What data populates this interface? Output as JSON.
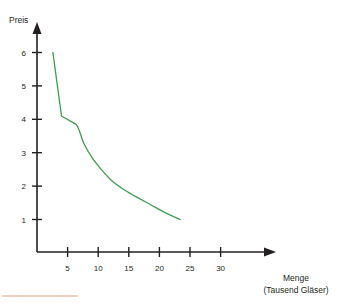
{
  "chart_data": {
    "type": "line",
    "title": "",
    "subtitle": "",
    "xlabel": "Menge",
    "xlabel_sub": "(Tausend Gläser)",
    "ylabel": "Preis",
    "xlim": [
      0,
      33
    ],
    "ylim": [
      0,
      6.6
    ],
    "xticks": [
      5,
      10,
      15,
      20,
      25,
      30
    ],
    "yticks": [
      1,
      2,
      3,
      4,
      5,
      6
    ],
    "xtick_labels": [
      "5",
      "10",
      "15",
      "20",
      "25",
      "30"
    ],
    "ytick_labels": [
      "1",
      "2",
      "3",
      "4",
      "5",
      "6"
    ],
    "grid": false,
    "legend": false,
    "legend_position": "none",
    "series": [
      {
        "name": "Nachfragekurve",
        "color": "#3f9c52",
        "x": [
          2.6,
          4.0,
          6.4,
          7.6,
          9.0,
          10.5,
          12.0,
          14.0,
          16.0,
          18.5,
          21.0,
          23.4
        ],
        "y": [
          6.0,
          4.1,
          3.85,
          3.3,
          2.85,
          2.5,
          2.2,
          1.92,
          1.7,
          1.45,
          1.2,
          1.0
        ]
      }
    ],
    "annotations": []
  },
  "axes": {
    "y_axis_title": "Preis",
    "x_axis_title": "Menge",
    "x_axis_subtitle": "(Tausend Gläser)"
  },
  "colors": {
    "curve": "#3f9c52",
    "axis": "#231f20",
    "text": "#231f20",
    "background": "#ffffff",
    "footer_rule": "#f0bfa8"
  },
  "decorations": {
    "footer_rule_present": true
  }
}
